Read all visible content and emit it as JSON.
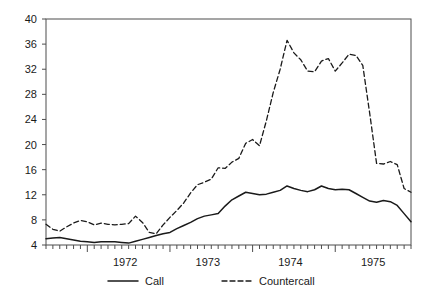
{
  "chart_data": {
    "type": "line",
    "title": "",
    "xlabel": "",
    "ylabel": "",
    "ylim": [
      4,
      40
    ],
    "ytick_step": 4,
    "yticks": [
      4,
      8,
      12,
      16,
      20,
      24,
      28,
      32,
      36,
      40
    ],
    "xticks_major": [
      "1972",
      "1973",
      "1974",
      "1975"
    ],
    "x_minor_tick_count_per_year": 12,
    "grid": false,
    "legend_position": "bottom-center",
    "frame": true,
    "x_start_label": "1971-07",
    "x_end_label": "1975-12",
    "x": [
      "1971-07",
      "1971-08",
      "1971-09",
      "1971-10",
      "1971-11",
      "1971-12",
      "1972-01",
      "1972-02",
      "1972-03",
      "1972-04",
      "1972-05",
      "1972-06",
      "1972-07",
      "1972-08",
      "1972-09",
      "1972-10",
      "1972-11",
      "1972-12",
      "1973-01",
      "1973-02",
      "1973-03",
      "1973-04",
      "1973-05",
      "1973-06",
      "1973-07",
      "1973-08",
      "1973-09",
      "1973-10",
      "1973-11",
      "1973-12",
      "1974-01",
      "1974-02",
      "1974-03",
      "1974-04",
      "1974-05",
      "1974-06",
      "1974-07",
      "1974-08",
      "1974-09",
      "1974-10",
      "1974-11",
      "1974-12",
      "1975-01",
      "1975-02",
      "1975-03",
      "1975-04",
      "1975-05",
      "1975-06",
      "1975-07",
      "1975-08",
      "1975-09",
      "1975-10",
      "1975-11",
      "1975-12"
    ],
    "series": [
      {
        "name": "Call",
        "style": "solid",
        "color": "#1a1a1a",
        "values": [
          5.0,
          5.1,
          5.2,
          5.0,
          4.8,
          4.6,
          4.5,
          4.4,
          4.5,
          4.5,
          4.5,
          4.4,
          4.3,
          4.6,
          4.9,
          5.2,
          5.5,
          5.8,
          6.0,
          6.6,
          7.1,
          7.6,
          8.2,
          8.6,
          8.8,
          9.0,
          10.2,
          11.2,
          11.8,
          12.4,
          12.2,
          12.0,
          12.1,
          12.4,
          12.7,
          13.4,
          13.0,
          12.7,
          12.5,
          12.8,
          13.4,
          13.0,
          12.8,
          12.9,
          12.8,
          12.2,
          11.6,
          11.0,
          10.8,
          11.1,
          10.9,
          10.3,
          9.0,
          7.7
        ]
      },
      {
        "name": "Countercall",
        "style": "dashed",
        "color": "#1a1a1a",
        "values": [
          7.3,
          6.5,
          6.2,
          6.9,
          7.5,
          7.9,
          7.7,
          7.2,
          7.5,
          7.3,
          7.2,
          7.3,
          7.4,
          8.6,
          7.6,
          6.0,
          5.8,
          7.2,
          8.4,
          9.5,
          10.7,
          12.3,
          13.6,
          14.0,
          14.5,
          16.3,
          16.2,
          17.2,
          17.8,
          20.2,
          20.8,
          19.8,
          23.8,
          28.3,
          32.0,
          36.6,
          34.6,
          33.5,
          31.7,
          31.6,
          33.3,
          33.7,
          31.7,
          33.0,
          34.4,
          34.2,
          32.6,
          25.0,
          17.0,
          16.9,
          17.3,
          16.8,
          13.0,
          12.4
        ]
      }
    ],
    "legend": [
      {
        "label": "Call",
        "style": "solid"
      },
      {
        "label": "Countercall",
        "style": "dashed"
      }
    ]
  },
  "colors": {
    "line": "#1a1a1a",
    "frame": "#4d4d4d",
    "background": "#ffffff",
    "text": "#1a1a1a"
  }
}
